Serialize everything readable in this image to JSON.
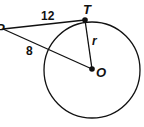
{
  "diagram": {
    "points": {
      "P": "P",
      "T": "T",
      "O": "O"
    },
    "labels": {
      "tangent_length": "12",
      "external_segment": "8",
      "radius": "r"
    }
  }
}
